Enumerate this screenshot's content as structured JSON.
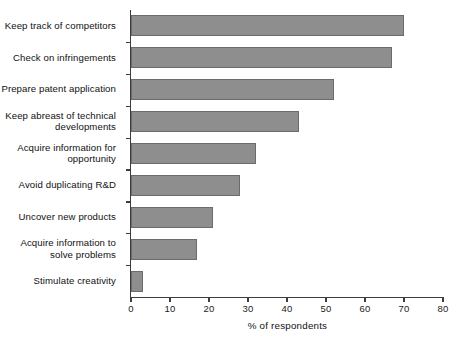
{
  "chart_data": {
    "type": "bar",
    "orientation": "horizontal",
    "title": "",
    "xlabel": "% of respondents",
    "ylabel": "",
    "xlim": [
      0,
      80
    ],
    "xticks": [
      0,
      10,
      20,
      30,
      40,
      50,
      60,
      70,
      80
    ],
    "grid": false,
    "legend": null,
    "bar_color": "#8e8e8e",
    "bar_edge_color": "#6b6b6b",
    "axis_color": "#3d3d3d",
    "categories": [
      "Keep track of competitors",
      "Check on infringements",
      "Prepare patent application",
      "Keep abreast of technical\ndevelopments",
      "Acquire information for\nopportunity",
      "Avoid duplicating R&D",
      "Uncover new products",
      "Acquire information to\nsolve problems",
      "Stimulate creativity"
    ],
    "values": [
      70,
      67,
      52,
      43,
      32,
      28,
      21,
      17,
      3
    ]
  },
  "axis": {
    "x_title": "% of respondents",
    "tick_labels": [
      "0",
      "10",
      "20",
      "30",
      "40",
      "50",
      "60",
      "70",
      "80"
    ]
  }
}
